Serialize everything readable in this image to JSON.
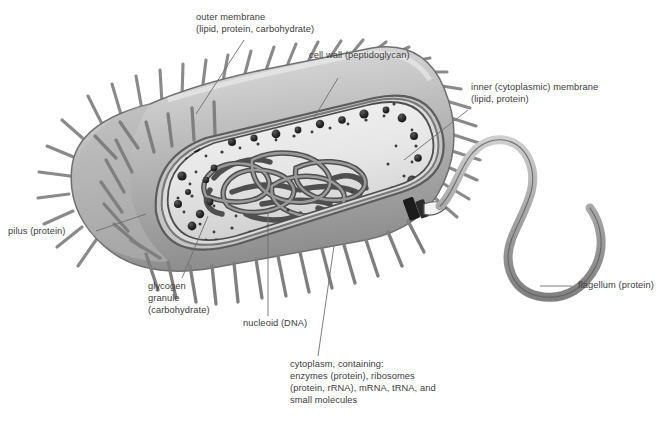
{
  "figure": {
    "caption": "",
    "background": "#ffffff",
    "text_color": "#3b3b3b",
    "leader_color": "#6e6e6e"
  },
  "palette": {
    "capsule_light": "#d8d8d8",
    "capsule_mid": "#a8a8a8",
    "capsule_dark": "#8f8f8f",
    "pilus": "#8c8c8c",
    "pilus_dark": "#6f6f6f",
    "cytoplasm": "#eceaea",
    "cytoplasm_shade": "#d3d3d3",
    "granule": "#2b2b2b",
    "ribosome": "#3a3a3a",
    "dna": "#7c7c7c",
    "dna_outline": "#4a4a4a",
    "flagellum": "#a9a9a9",
    "basal_body": "#1f1f1f"
  },
  "labels": [
    {
      "id": "outer-membrane",
      "lines": [
        "outer membrane",
        "(lipid, protein, carbohydrate)"
      ],
      "x": 196,
      "y": 12,
      "align": "left"
    },
    {
      "id": "cell-wall",
      "lines": [
        "cell wall (peptidoglycan)"
      ],
      "x": 309,
      "y": 50,
      "align": "left"
    },
    {
      "id": "inner-membrane",
      "lines": [
        "inner (cytoplasmic) membrane",
        "(lipid, protein)"
      ],
      "x": 471,
      "y": 82,
      "align": "left"
    },
    {
      "id": "pilus",
      "lines": [
        "pilus (protein)"
      ],
      "x": 8,
      "y": 228,
      "align": "left"
    },
    {
      "id": "glycogen-granule",
      "lines": [
        "glycogen",
        "granule",
        "(carbohydrate)"
      ],
      "x": 148,
      "y": 282,
      "align": "left"
    },
    {
      "id": "nucleoid",
      "lines": [
        "nucleoid (DNA)"
      ],
      "x": 243,
      "y": 319,
      "align": "left"
    },
    {
      "id": "flagellum",
      "lines": [
        "flagellum (protein)"
      ],
      "x": 578,
      "y": 280,
      "align": "left"
    },
    {
      "id": "cytoplasm",
      "lines": [
        "cytoplasm, containing:",
        "enzymes (protein), ribosomes",
        "(protein, rRNA), mRNA, tRNA, and",
        "small molecules"
      ],
      "x": 290,
      "y": 360,
      "align": "left"
    }
  ],
  "structures": {
    "capsule": "outer capsule with pili",
    "pili_count": 58,
    "granule_count": 64,
    "ribosome_count": 120,
    "flagellum_shape": "wavy single polar flagellum"
  }
}
